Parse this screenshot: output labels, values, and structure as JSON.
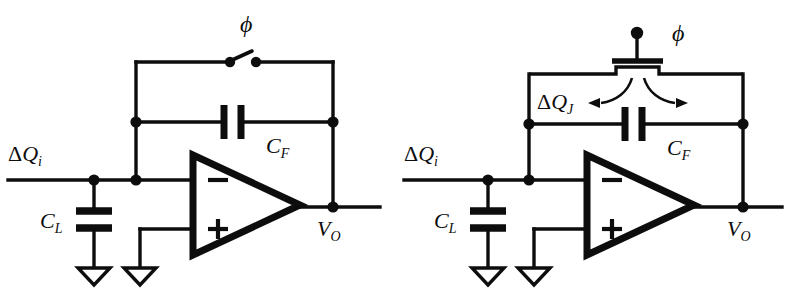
{
  "figure": {
    "background_color": "#ffffff",
    "ink_color": "#0d0d0d",
    "width": 788,
    "height": 293,
    "panel_count": 2
  },
  "symbols": {
    "delta": "Δ",
    "phi": "ϕ",
    "minus": "−",
    "plus": "+"
  },
  "left_circuit": {
    "name": "ideal-switch-charge-amplifier",
    "labels": {
      "input_charge": "ΔQ",
      "input_charge_sub": "i",
      "load_cap": "C",
      "load_cap_sub": "L",
      "feedback_cap": "C",
      "feedback_cap_sub": "F",
      "output_voltage": "V",
      "output_voltage_sub": "O",
      "clock_phase": "ϕ",
      "opamp_inverting": "−",
      "opamp_noninverting": "+"
    },
    "components": [
      {
        "id": "reset-switch",
        "type": "switch",
        "state": "open",
        "label": "ϕ"
      },
      {
        "id": "feedback-capacitor",
        "type": "capacitor",
        "orientation": "vertical-plates",
        "label": "C_F"
      },
      {
        "id": "load-capacitor",
        "type": "capacitor",
        "orientation": "horizontal-plates",
        "label": "C_L"
      },
      {
        "id": "operational-amplifier",
        "type": "opamp",
        "inputs": [
          "−",
          "+"
        ]
      },
      {
        "id": "ground-load",
        "type": "ground",
        "style": "open-triangle"
      },
      {
        "id": "ground-noninverting",
        "type": "ground",
        "style": "open-triangle"
      }
    ]
  },
  "right_circuit": {
    "name": "mosfet-switch-charge-injection-amplifier",
    "labels": {
      "input_charge": "ΔQ",
      "input_charge_sub": "i",
      "injected_charge": "ΔQ",
      "injected_charge_sub": "J",
      "load_cap": "C",
      "load_cap_sub": "L",
      "feedback_cap": "C",
      "feedback_cap_sub": "F",
      "output_voltage": "V",
      "output_voltage_sub": "O",
      "clock_phase": "ϕ",
      "opamp_inverting": "−",
      "opamp_noninverting": "+"
    },
    "components": [
      {
        "id": "mosfet-reset-switch",
        "type": "mosfet",
        "gate_label": "ϕ",
        "gate_terminal": "dot"
      },
      {
        "id": "charge-injection-arrows",
        "type": "arrow-pair",
        "direction": "split-left-right",
        "label": "ΔQ_J"
      },
      {
        "id": "feedback-capacitor",
        "type": "capacitor",
        "orientation": "vertical-plates",
        "label": "C_F"
      },
      {
        "id": "load-capacitor",
        "type": "capacitor",
        "orientation": "horizontal-plates",
        "label": "C_L"
      },
      {
        "id": "operational-amplifier",
        "type": "opamp",
        "inputs": [
          "−",
          "+"
        ]
      },
      {
        "id": "ground-load",
        "type": "ground",
        "style": "open-triangle"
      },
      {
        "id": "ground-noninverting",
        "type": "ground",
        "style": "open-triangle"
      }
    ]
  }
}
